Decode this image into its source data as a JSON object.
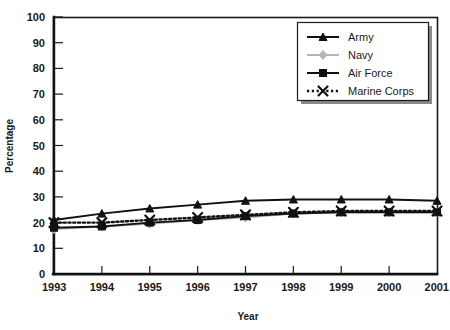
{
  "chart_data": {
    "type": "line",
    "title": "",
    "xlabel": "Year",
    "ylabel": "Percentage",
    "categories": [
      "1993",
      "1994",
      "1995",
      "1996",
      "1997",
      "1998",
      "1999",
      "2000",
      "2001"
    ],
    "x": [
      1993,
      1994,
      1995,
      1996,
      1997,
      1998,
      1999,
      2000,
      2001
    ],
    "xlim": [
      1993,
      2001
    ],
    "ylim": [
      0,
      100
    ],
    "ytick_labels": [
      "0",
      "10",
      "20",
      "30",
      "40",
      "50",
      "60",
      "70",
      "80",
      "90",
      "100"
    ],
    "ytick_values": [
      0,
      10,
      20,
      30,
      40,
      50,
      60,
      70,
      80,
      90,
      100
    ],
    "grid": false,
    "legend_position": "top-right",
    "series": [
      {
        "name": "Army",
        "values": [
          21,
          23.5,
          25.5,
          27,
          28.5,
          29,
          29,
          29,
          28.5
        ],
        "color": "#111111",
        "marker": "triangle",
        "dash": "solid"
      },
      {
        "name": "Navy",
        "values": [
          17.5,
          18.5,
          19.5,
          21,
          22,
          23.5,
          24,
          24,
          24
        ],
        "color": "#b5b5b5",
        "marker": "diamond",
        "dash": "solid"
      },
      {
        "name": "Air Force",
        "values": [
          18,
          18.5,
          20,
          21,
          22.5,
          23.5,
          24,
          24,
          24
        ],
        "color": "#111111",
        "marker": "square",
        "dash": "solid"
      },
      {
        "name": "Marine Corps",
        "values": [
          20,
          20,
          21,
          22,
          23,
          24,
          24.5,
          24.5,
          24.5
        ],
        "color": "#111111",
        "marker": "x",
        "dash": "dotted"
      }
    ]
  },
  "axes": {
    "y_title": "Percentage",
    "x_title": "Year"
  },
  "legend": {
    "entries": [
      {
        "label": "Army"
      },
      {
        "label": "Navy"
      },
      {
        "label": "Air Force"
      },
      {
        "label": "Marine Corps"
      }
    ]
  }
}
